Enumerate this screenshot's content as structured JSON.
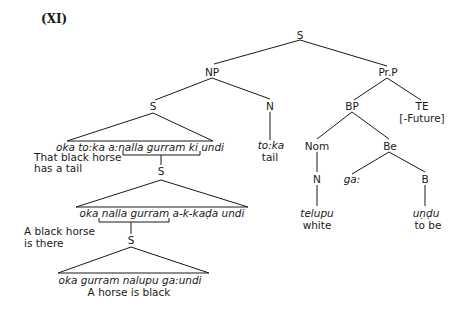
{
  "title": "(XI)",
  "nodes": {
    "root_s": "S",
    "np": "NP",
    "prp": "Pr.P",
    "s_left": "S",
    "n_noun": "N",
    "bp": "BP",
    "te": "TE",
    "te_feature": "[-Future]",
    "nom": "Nom",
    "be": "Be",
    "n_nom": "N",
    "b": "B",
    "s_mid": "S",
    "s_low": "S"
  },
  "leaves": {
    "toka": "to:ka",
    "toka_gloss": "tail",
    "telupu": "telupu",
    "telupu_gloss": "white",
    "gaa": "ga:",
    "undu": "uṇḍu",
    "undu_gloss": "to be"
  },
  "clauses": {
    "top": {
      "text": "oka to:ka a:nalla gurram ki undi",
      "gloss_line1": "That black horse",
      "gloss_line2": "has a tail"
    },
    "middle": {
      "text": "oka nalla gurram a-k-kaḍa undi",
      "gloss_line1": "A black horse",
      "gloss_line2": "is there"
    },
    "bottom": {
      "text": "oka gurram nalupu ga:undi",
      "gloss": "A horse is black"
    }
  },
  "colors": {
    "line": "#1a1a1a",
    "background": "#ffffff"
  }
}
